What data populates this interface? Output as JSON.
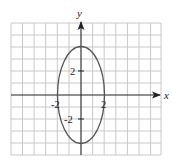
{
  "figure": {
    "equation": "x^2/4 + y^2/16 = 1",
    "axes": {
      "x_label": "x",
      "y_label": "y"
    },
    "tick_labels": {
      "x_neg": "-2",
      "x_pos": "2",
      "y_pos": "2",
      "y_neg": "-2"
    },
    "ellipse": {
      "center": [
        0,
        0
      ],
      "semi_axis_x": 2,
      "semi_axis_y": 4
    },
    "grid": {
      "x_range": [
        -6,
        7
      ],
      "y_range": [
        -5,
        6
      ],
      "step": 1
    },
    "colors": {
      "grid": "#c8c8c8",
      "axis": "#222222",
      "curve": "#555555"
    }
  }
}
